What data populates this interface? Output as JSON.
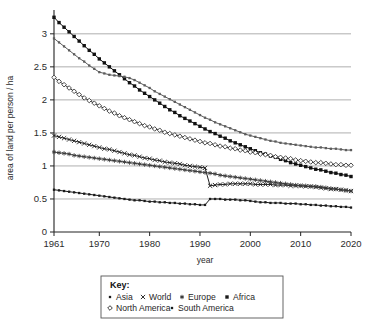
{
  "chart_data": {
    "type": "line",
    "title": "",
    "xlabel": "year",
    "ylabel": "area of land per person / ha",
    "xlim": [
      1961,
      2020
    ],
    "ylim": [
      0,
      3.3
    ],
    "grid": true,
    "legend_position": "bottom",
    "legend_title": "Key:",
    "xticks": [
      1961,
      1970,
      1980,
      1990,
      2000,
      2010,
      2020
    ],
    "xtick_labels": [
      "1961",
      "1970",
      "1980",
      "1990",
      "2000",
      "2010",
      "2020"
    ],
    "yticks": [
      0,
      0.5,
      1,
      1.5,
      2,
      2.5,
      3
    ],
    "ytick_labels": [
      "0",
      "0.5",
      "1",
      "1.5",
      "2",
      "2.5",
      "3"
    ],
    "gridline_values": [
      0.5,
      1,
      1.5,
      2,
      2.5,
      3
    ],
    "x": [
      1961,
      1962,
      1963,
      1964,
      1965,
      1966,
      1967,
      1968,
      1969,
      1970,
      1971,
      1972,
      1973,
      1974,
      1975,
      1976,
      1977,
      1978,
      1979,
      1980,
      1981,
      1982,
      1983,
      1984,
      1985,
      1986,
      1987,
      1988,
      1989,
      1990,
      1991,
      1992,
      1993,
      1994,
      1995,
      1996,
      1997,
      1998,
      1999,
      2000,
      2001,
      2002,
      2003,
      2004,
      2005,
      2006,
      2007,
      2008,
      2009,
      2010,
      2011,
      2012,
      2013,
      2014,
      2015,
      2016,
      2017,
      2018,
      2019,
      2020
    ],
    "series": [
      {
        "name": "Africa",
        "marker": "filled-square",
        "color": "#111111",
        "values": [
          3.25,
          3.17,
          3.1,
          3.03,
          2.96,
          2.89,
          2.82,
          2.75,
          2.69,
          2.62,
          2.56,
          2.5,
          2.44,
          2.38,
          2.32,
          2.26,
          2.21,
          2.15,
          2.1,
          2.05,
          2.0,
          1.95,
          1.9,
          1.85,
          1.81,
          1.76,
          1.72,
          1.68,
          1.64,
          1.6,
          1.56,
          1.52,
          1.49,
          1.45,
          1.42,
          1.38,
          1.35,
          1.32,
          1.29,
          1.26,
          1.23,
          1.2,
          1.18,
          1.15,
          1.13,
          1.1,
          1.08,
          1.05,
          1.03,
          1.01,
          0.99,
          0.97,
          0.95,
          0.94,
          0.92,
          0.9,
          0.89,
          0.87,
          0.86,
          0.84
        ]
      },
      {
        "name": "Asia",
        "marker": "small-dot",
        "color": "#5c5c5c",
        "values": [
          2.93,
          2.87,
          2.81,
          2.75,
          2.69,
          2.63,
          2.58,
          2.52,
          2.47,
          2.42,
          2.4,
          2.38,
          2.37,
          2.36,
          2.35,
          2.33,
          2.3,
          2.26,
          2.22,
          2.18,
          2.13,
          2.09,
          2.05,
          2.01,
          1.97,
          1.93,
          1.89,
          1.85,
          1.81,
          1.77,
          1.73,
          1.7,
          1.66,
          1.63,
          1.6,
          1.57,
          1.54,
          1.51,
          1.48,
          1.46,
          1.44,
          1.42,
          1.4,
          1.38,
          1.37,
          1.35,
          1.34,
          1.33,
          1.32,
          1.31,
          1.3,
          1.29,
          1.28,
          1.28,
          1.27,
          1.26,
          1.26,
          1.25,
          1.24,
          1.24
        ]
      },
      {
        "name": "North America",
        "marker": "open-diamond",
        "color": "#2e2e2e",
        "values": [
          2.34,
          2.28,
          2.23,
          2.18,
          2.13,
          2.08,
          2.03,
          1.99,
          1.95,
          1.91,
          1.87,
          1.83,
          1.8,
          1.76,
          1.73,
          1.7,
          1.67,
          1.64,
          1.61,
          1.59,
          1.56,
          1.54,
          1.51,
          1.49,
          1.47,
          1.45,
          1.43,
          1.41,
          1.39,
          1.37,
          1.35,
          1.34,
          1.32,
          1.3,
          1.29,
          1.27,
          1.26,
          1.24,
          1.23,
          1.21,
          1.2,
          1.18,
          1.17,
          1.16,
          1.14,
          1.13,
          1.12,
          1.11,
          1.09,
          1.08,
          1.07,
          1.06,
          1.05,
          1.05,
          1.04,
          1.03,
          1.02,
          1.02,
          1.01,
          1.01
        ]
      },
      {
        "name": "World",
        "marker": "cross",
        "color": "#1f1f1f",
        "values": [
          1.46,
          1.44,
          1.42,
          1.4,
          1.38,
          1.36,
          1.34,
          1.32,
          1.3,
          1.28,
          1.26,
          1.25,
          1.23,
          1.21,
          1.19,
          1.17,
          1.16,
          1.14,
          1.12,
          1.11,
          1.09,
          1.08,
          1.06,
          1.05,
          1.04,
          1.03,
          1.01,
          1.0,
          0.99,
          0.98,
          0.97,
          0.7,
          0.71,
          0.72,
          0.72,
          0.73,
          0.73,
          0.73,
          0.73,
          0.73,
          0.72,
          0.72,
          0.72,
          0.72,
          0.71,
          0.71,
          0.71,
          0.7,
          0.7,
          0.7,
          0.69,
          0.69,
          0.68,
          0.67,
          0.66,
          0.65,
          0.65,
          0.64,
          0.63,
          0.62
        ]
      },
      {
        "name": "Europe",
        "marker": "star",
        "color": "#3a3a3a",
        "values": [
          1.21,
          1.2,
          1.19,
          1.18,
          1.16,
          1.15,
          1.14,
          1.13,
          1.12,
          1.11,
          1.1,
          1.09,
          1.08,
          1.07,
          1.06,
          1.05,
          1.04,
          1.03,
          1.02,
          1.01,
          1.0,
          0.99,
          0.98,
          0.97,
          0.96,
          0.95,
          0.94,
          0.93,
          0.92,
          0.91,
          0.9,
          0.89,
          0.88,
          0.86,
          0.85,
          0.84,
          0.83,
          0.82,
          0.81,
          0.8,
          0.79,
          0.78,
          0.77,
          0.76,
          0.75,
          0.74,
          0.73,
          0.72,
          0.71,
          0.7,
          0.7,
          0.69,
          0.69,
          0.68,
          0.67,
          0.66,
          0.65,
          0.64,
          0.63,
          0.62
        ]
      },
      {
        "name": "South America",
        "marker": "small-dot",
        "color": "#1a1a1a",
        "values": [
          0.64,
          0.63,
          0.62,
          0.61,
          0.6,
          0.59,
          0.58,
          0.57,
          0.56,
          0.55,
          0.54,
          0.53,
          0.52,
          0.51,
          0.5,
          0.49,
          0.48,
          0.48,
          0.47,
          0.46,
          0.46,
          0.45,
          0.45,
          0.44,
          0.44,
          0.43,
          0.43,
          0.42,
          0.42,
          0.41,
          0.41,
          0.5,
          0.5,
          0.5,
          0.49,
          0.49,
          0.49,
          0.48,
          0.48,
          0.47,
          0.46,
          0.45,
          0.45,
          0.44,
          0.44,
          0.44,
          0.43,
          0.43,
          0.43,
          0.42,
          0.42,
          0.41,
          0.41,
          0.4,
          0.4,
          0.39,
          0.39,
          0.38,
          0.38,
          0.37
        ]
      }
    ],
    "legend_entries": [
      {
        "label": "Asia",
        "marker": "small-dot"
      },
      {
        "label": "World",
        "marker": "cross"
      },
      {
        "label": "Europe",
        "marker": "star"
      },
      {
        "label": "Africa",
        "marker": "filled-square"
      },
      {
        "label": "North America",
        "marker": "open-diamond"
      },
      {
        "label": "South America",
        "marker": "small-dot"
      }
    ]
  }
}
